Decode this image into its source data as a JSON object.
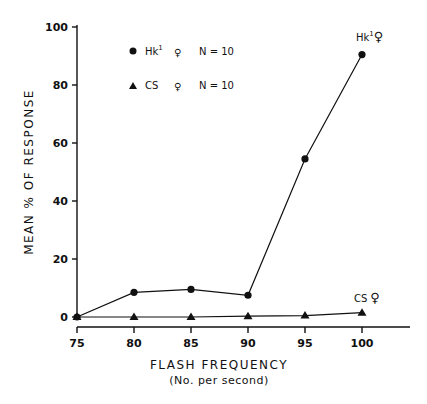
{
  "chart_data": {
    "type": "line",
    "title": "",
    "xlabel": "FLASH FREQUENCY",
    "xlabel_sub": "(No. per second)",
    "ylabel": "MEAN % OF RESPONSE",
    "x": [
      75,
      80,
      85,
      90,
      95,
      100
    ],
    "x_tick_labels": [
      "75",
      "80",
      "85",
      "90",
      "95",
      "100"
    ],
    "y_tick_labels": [
      "0",
      "20",
      "40",
      "60",
      "80",
      "100"
    ],
    "ylim": [
      0,
      100
    ],
    "xlim": [
      75,
      104
    ],
    "grid": false,
    "legend_position": "upper-left",
    "series": [
      {
        "name": "Hk1 ♀ N=10",
        "marker": "circle",
        "values": [
          0,
          8.5,
          9.5,
          7.5,
          54.5,
          90.5
        ]
      },
      {
        "name": "CS ♀ N=10",
        "marker": "triangle",
        "values": [
          0,
          0,
          0,
          0.3,
          0.5,
          1.5
        ]
      }
    ],
    "annotations": [
      {
        "text": "Hk1 ♀",
        "x": 100,
        "y": 90.5
      },
      {
        "text": "CS ♀",
        "x": 100,
        "y": 1.5
      }
    ]
  },
  "legend": {
    "items": [
      {
        "label": "Hk",
        "sup": "1",
        "sex": "♀",
        "n": "N = 10"
      },
      {
        "label": "CS",
        "sup": "",
        "sex": "♀",
        "n": "N = 10"
      }
    ]
  },
  "annotations": {
    "hk": {
      "label": "Hk",
      "sup": "1",
      "sex": "♀"
    },
    "cs": {
      "label": "CS",
      "sex": "♀"
    }
  }
}
